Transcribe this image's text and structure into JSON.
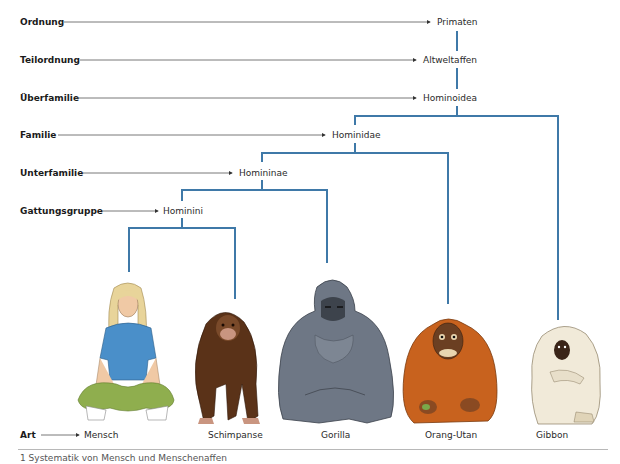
{
  "ranks": [
    {
      "label": "Ordnung",
      "taxon": "Primaten"
    },
    {
      "label": "Teilordnung",
      "taxon": "Altweltaffen"
    },
    {
      "label": "Überfamilie",
      "taxon": "Hominoidea"
    },
    {
      "label": "Familie",
      "taxon": "Hominidae"
    },
    {
      "label": "Unterfamilie",
      "taxon": "Homininae"
    },
    {
      "label": "Gattungsgruppe",
      "taxon": "Hominini"
    },
    {
      "label": "Art",
      "taxon": "Mensch"
    }
  ],
  "species": [
    {
      "name": "Mensch",
      "icon": "human-sitting-icon"
    },
    {
      "name": "Schimpanse",
      "icon": "chimpanzee-icon"
    },
    {
      "name": "Gorilla",
      "icon": "gorilla-icon"
    },
    {
      "name": "Orang-Utan",
      "icon": "orangutan-icon"
    },
    {
      "name": "Gibbon",
      "icon": "gibbon-icon"
    }
  ],
  "colors": {
    "tree_line": "#3f79a8",
    "arrow_line": "#555555",
    "human_shirt": "#4a8fc9",
    "human_pants": "#8fae4e",
    "human_hair": "#e8d49a",
    "chimp": "#5a3218",
    "gorilla": "#6e7785",
    "orangutan": "#c8621e",
    "gibbon": "#f1ead9"
  },
  "caption": "1 Systematik von Mensch und Menschenaffen"
}
